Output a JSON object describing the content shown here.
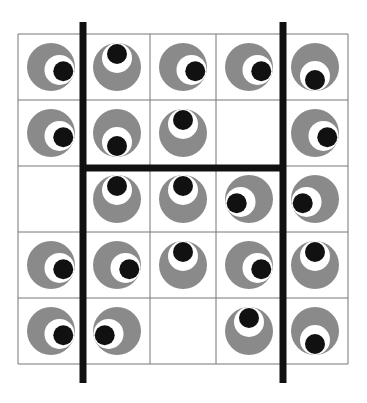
{
  "puzzle": {
    "rows": 5,
    "cols": 5,
    "grid": {
      "left": 18,
      "top": 34,
      "cell": 66
    },
    "colors": {
      "ring": "#8a8a8a",
      "white": "#ffffff",
      "pupil": "#111111",
      "grid_line": "#777777",
      "wall": "#111111"
    },
    "cells": [
      [
        "right",
        "up",
        "right",
        "right",
        "down"
      ],
      [
        "right",
        "down",
        "up",
        "empty",
        "right"
      ],
      [
        "empty",
        "up",
        "up",
        "left",
        "left"
      ],
      [
        "right",
        "right",
        "up",
        "right",
        "up"
      ],
      [
        "right",
        "left",
        "empty",
        "up",
        "down"
      ]
    ],
    "walls": [
      {
        "orientation": "vertical",
        "x": 83,
        "y1": 22,
        "y2": 383
      },
      {
        "orientation": "vertical",
        "x": 283,
        "y1": 22,
        "y2": 383
      },
      {
        "orientation": "horizontal",
        "y": 168,
        "x1": 80,
        "x2": 286
      }
    ]
  }
}
